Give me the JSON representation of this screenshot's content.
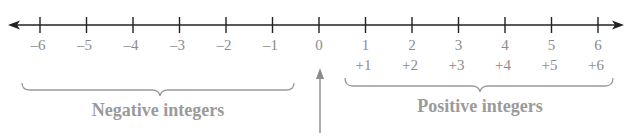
{
  "diagram": {
    "type": "number_line",
    "axis": {
      "min_visible": -6,
      "max_visible": 6,
      "arrows_both_ends": true,
      "line_color": "#222222",
      "label_color": "#8c8c8c"
    },
    "ticks": [
      {
        "value": -6,
        "label": "–6",
        "signed_label": ""
      },
      {
        "value": -5,
        "label": "–5",
        "signed_label": ""
      },
      {
        "value": -4,
        "label": "–4",
        "signed_label": ""
      },
      {
        "value": -3,
        "label": "–3",
        "signed_label": ""
      },
      {
        "value": -2,
        "label": "–2",
        "signed_label": ""
      },
      {
        "value": -1,
        "label": "–1",
        "signed_label": ""
      },
      {
        "value": 0,
        "label": "0",
        "signed_label": ""
      },
      {
        "value": 1,
        "label": "1",
        "signed_label": "+1"
      },
      {
        "value": 2,
        "label": "2",
        "signed_label": "+2"
      },
      {
        "value": 3,
        "label": "3",
        "signed_label": "+3"
      },
      {
        "value": 4,
        "label": "4",
        "signed_label": "+4"
      },
      {
        "value": 5,
        "label": "5",
        "signed_label": "+5"
      },
      {
        "value": 6,
        "label": "6",
        "signed_label": "+6"
      }
    ],
    "groups": {
      "negative": {
        "label": "Negative integers",
        "range": [
          -6,
          -1
        ]
      },
      "positive": {
        "label": "Positive integers",
        "range": [
          1,
          6
        ]
      }
    },
    "zero_pointer": {
      "target": 0,
      "icon": "up-arrow-icon",
      "color": "#8c8c8c"
    }
  }
}
